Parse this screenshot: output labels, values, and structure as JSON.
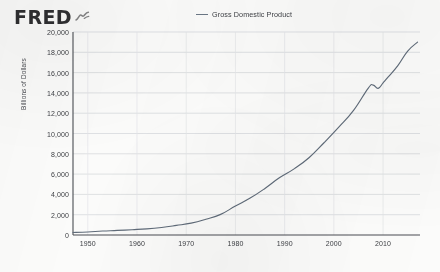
{
  "brand": {
    "wordmark": "FRED",
    "mark_icon": "fred-squiggle-icon"
  },
  "legend": {
    "position": "top-center",
    "entries": [
      {
        "label": "Gross Domestic Product",
        "color": "#6b7785",
        "marker": "line"
      }
    ]
  },
  "chart_data": {
    "type": "line",
    "title": "",
    "subtitle": "",
    "xlabel": "",
    "ylabel": "Billions of Dollars",
    "grid": true,
    "legend_position": "top-center",
    "xlim": [
      1947,
      2017.5
    ],
    "ylim": [
      0,
      20000
    ],
    "xticks": [
      1950,
      1960,
      1970,
      1980,
      1990,
      2000,
      2010
    ],
    "xtick_labels": [
      "1950",
      "1960",
      "1970",
      "1980",
      "1990",
      "2000",
      "2010"
    ],
    "yticks": [
      0,
      2000,
      4000,
      6000,
      8000,
      10000,
      12000,
      14000,
      16000,
      18000,
      20000
    ],
    "ytick_labels": [
      "0",
      "2,000",
      "4,000",
      "6,000",
      "8,000",
      "10,000",
      "12,000",
      "14,000",
      "16,000",
      "18,000",
      "20,000"
    ],
    "series": [
      {
        "name": "Gross Domestic Product",
        "color": "#5f6b79",
        "x": [
          1947,
          1950,
          1953,
          1956,
          1959,
          1962,
          1965,
          1968,
          1971,
          1974,
          1977,
          1980,
          1983,
          1986,
          1989,
          1992,
          1995,
          1998,
          2001,
          2004,
          2007,
          2008,
          2009,
          2010,
          2011,
          2013,
          2015,
          2017
        ],
        "values": [
          243,
          300,
          389,
          449,
          522,
          605,
          744,
          942,
          1167,
          1549,
          2032,
          2857,
          3638,
          4590,
          5657,
          6539,
          7640,
          9089,
          10622,
          12274,
          14478,
          14769,
          14448,
          14992,
          15543,
          16692,
          18121,
          19000
        ],
        "annotations": [
          {
            "label": "recession dip",
            "x": 2009,
            "y": 14448
          }
        ]
      }
    ]
  }
}
